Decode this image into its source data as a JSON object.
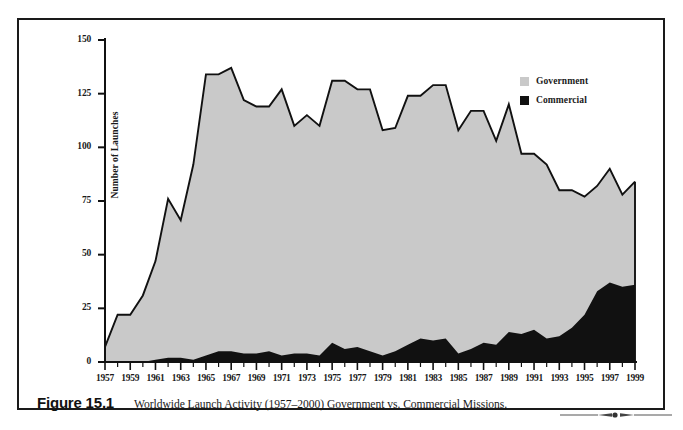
{
  "figure": {
    "number_label": "Figure 15.1",
    "caption": "Worldwide Launch Activity (1957–2000) Government vs. Commercial Missions."
  },
  "legend": {
    "position": "top-right",
    "items": [
      {
        "label": "Government",
        "color": "#c9c9c9",
        "swatch_icon": "legend-swatch-government"
      },
      {
        "label": "Commercial",
        "color": "#111111",
        "swatch_icon": "legend-swatch-commercial"
      }
    ]
  },
  "axes": {
    "y_title": "Number of Launches",
    "y_ticks": [
      "0",
      "25",
      "50",
      "75",
      "100",
      "125",
      "150"
    ],
    "x_ticks": [
      "1957",
      "1959",
      "1961",
      "1963",
      "1965",
      "1967",
      "1969",
      "1971",
      "1973",
      "1975",
      "1977",
      "1979",
      "1981",
      "1983",
      "1985",
      "1987",
      "1989",
      "1991",
      "1993",
      "1995",
      "1997",
      "1999"
    ]
  },
  "colors": {
    "government_fill": "#c9c9c9",
    "commercial_fill": "#111111",
    "outline": "#111111",
    "frame": "#1a1a1a",
    "background": "#ffffff"
  },
  "chart_data": {
    "type": "area",
    "stacked": true,
    "title": "Worldwide Launch Activity (1957–2000) Government vs. Commercial Missions.",
    "xlabel": "",
    "ylabel": "Number of Launches",
    "xlim": [
      1957,
      1999
    ],
    "ylim": [
      0,
      150
    ],
    "grid": false,
    "legend_position": "top-right",
    "x": [
      1957,
      1958,
      1959,
      1960,
      1961,
      1962,
      1963,
      1964,
      1965,
      1966,
      1967,
      1968,
      1969,
      1970,
      1971,
      1972,
      1973,
      1974,
      1975,
      1976,
      1977,
      1978,
      1979,
      1980,
      1981,
      1982,
      1983,
      1984,
      1985,
      1986,
      1987,
      1988,
      1989,
      1990,
      1991,
      1992,
      1993,
      1994,
      1995,
      1996,
      1997,
      1998,
      1999
    ],
    "series": [
      {
        "name": "Commercial",
        "color": "#111111",
        "values": [
          0,
          0,
          0,
          0,
          1,
          2,
          2,
          1,
          3,
          5,
          5,
          4,
          4,
          5,
          3,
          4,
          4,
          3,
          9,
          6,
          7,
          5,
          3,
          5,
          8,
          11,
          10,
          11,
          4,
          6,
          9,
          8,
          14,
          13,
          15,
          11,
          12,
          16,
          22,
          33,
          37,
          35,
          36
        ]
      },
      {
        "name": "Government",
        "color": "#c9c9c9",
        "values": [
          7,
          22,
          22,
          31,
          46,
          74,
          64,
          91,
          131,
          129,
          132,
          118,
          115,
          114,
          124,
          106,
          111,
          107,
          122,
          125,
          120,
          122,
          105,
          104,
          116,
          113,
          119,
          118,
          104,
          111,
          108,
          95,
          106,
          84,
          82,
          81,
          68,
          64,
          55,
          49,
          53,
          43,
          48
        ]
      }
    ],
    "totals": [
      7,
      22,
      22,
      31,
      47,
      76,
      66,
      92,
      134,
      134,
      137,
      122,
      119,
      119,
      127,
      110,
      115,
      110,
      131,
      131,
      127,
      127,
      108,
      109,
      124,
      124,
      129,
      129,
      108,
      117,
      117,
      103,
      120,
      97,
      97,
      92,
      80,
      80,
      77,
      82,
      90,
      78,
      84
    ]
  }
}
